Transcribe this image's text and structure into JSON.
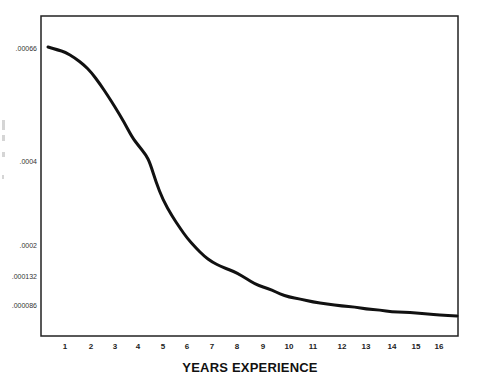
{
  "chart_data": {
    "type": "line",
    "title": "",
    "xlabel": "YEARS EXPERIENCE",
    "ylabel": "",
    "x": [
      1,
      2,
      3,
      4,
      5,
      6,
      7,
      8,
      9,
      10,
      11,
      12,
      13,
      14,
      15,
      16
    ],
    "x_tick_labels": [
      "1",
      "2",
      "3",
      "4",
      "5",
      "6",
      "7",
      "8",
      "9",
      "10",
      "11",
      "12",
      "13",
      "14",
      "15",
      "16"
    ],
    "y_tick_labels": [
      ".00066",
      ".0004",
      ".0002",
      ".000132",
      ".000086"
    ],
    "y_tick_values": [
      0.00066,
      0.0004,
      0.0002,
      0.000132,
      8.6e-05
    ],
    "series": [
      {
        "name": "",
        "color": "#111111",
        "values": [
          0.00065,
          0.00061,
          0.00053,
          0.00043,
          0.00031,
          0.00022,
          0.00017,
          0.000145,
          0.000113,
          0.000103,
          9.4e-05,
          8.8e-05,
          8.3e-05,
          7.8e-05,
          7.6e-05,
          7.3e-05
        ]
      }
    ],
    "grid": false,
    "legend": "none",
    "frame": "box"
  },
  "layout": {
    "frame": {
      "left": 41,
      "top": 16,
      "right": 458,
      "bottom": 336
    },
    "y_tick_pixels": [
      50,
      163,
      247,
      278,
      307
    ],
    "x_tick_pixels": [
      65,
      91,
      115,
      138,
      163,
      187,
      212,
      237,
      263,
      289,
      313,
      342,
      366,
      392,
      416,
      439
    ],
    "curve_pixels": [
      [
        48,
        47
      ],
      [
        58,
        50
      ],
      [
        65,
        52
      ],
      [
        75,
        58
      ],
      [
        84,
        65
      ],
      [
        91,
        72
      ],
      [
        100,
        84
      ],
      [
        108,
        96
      ],
      [
        115,
        107
      ],
      [
        124,
        122
      ],
      [
        132,
        137
      ],
      [
        138,
        145
      ],
      [
        146,
        155
      ],
      [
        150,
        163
      ],
      [
        156,
        182
      ],
      [
        163,
        200
      ],
      [
        172,
        216
      ],
      [
        180,
        228
      ],
      [
        187,
        238
      ],
      [
        196,
        248
      ],
      [
        204,
        256
      ],
      [
        212,
        262
      ],
      [
        222,
        267
      ],
      [
        230,
        270
      ],
      [
        237,
        273
      ],
      [
        247,
        279
      ],
      [
        255,
        284
      ],
      [
        263,
        287
      ],
      [
        272,
        290
      ],
      [
        280,
        294
      ],
      [
        289,
        297
      ],
      [
        300,
        299
      ],
      [
        313,
        302
      ],
      [
        327,
        304
      ],
      [
        342,
        306
      ],
      [
        355,
        307
      ],
      [
        366,
        309
      ],
      [
        380,
        310
      ],
      [
        392,
        312
      ],
      [
        404,
        312
      ],
      [
        416,
        313
      ],
      [
        428,
        314
      ],
      [
        439,
        315
      ],
      [
        457,
        316
      ]
    ]
  }
}
